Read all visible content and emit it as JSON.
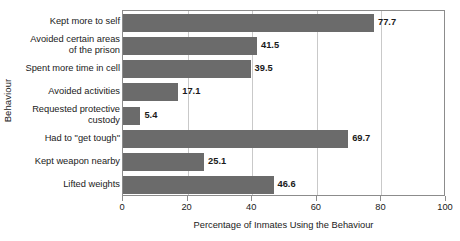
{
  "chart_data": {
    "type": "bar",
    "orientation": "horizontal",
    "title": "",
    "xlabel": "Percentage of Inmates Using the Behaviour",
    "ylabel": "Behaviour",
    "xlim": [
      0,
      100
    ],
    "xticks": [
      0,
      20,
      40,
      60,
      80,
      100
    ],
    "xtick_labels": [
      "0",
      "20",
      "40",
      "60",
      "80",
      "100"
    ],
    "grid": true,
    "grid_axis": "x",
    "legend": false,
    "bar_color": "#6b6b6b",
    "categories": [
      "Kept more to self",
      "Avoided certain areas\nof the prison",
      "Spent more time in cell",
      "Avoided activities",
      "Requested protective\ncustody",
      "Had to \"get tough\"",
      "Kept weapon nearby",
      "Lifted weights"
    ],
    "values": [
      77.7,
      41.5,
      39.5,
      17.1,
      5.4,
      69.7,
      25.1,
      46.6
    ],
    "value_labels": [
      "77.7",
      "41.5",
      "39.5",
      "17.1",
      "5.4",
      "69.7",
      "25.1",
      "46.6"
    ]
  }
}
